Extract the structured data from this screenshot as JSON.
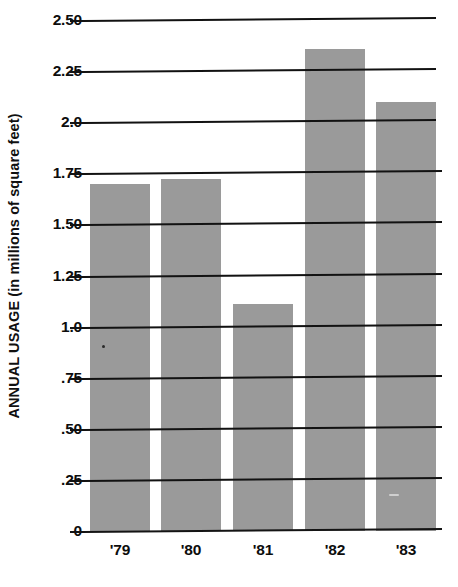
{
  "chart_data": {
    "type": "bar",
    "title": "",
    "subtitle": "",
    "xlabel": "",
    "ylabel": "ANNUAL USAGE (in millions of square feet)",
    "categories": [
      "'79",
      "'80",
      "'81",
      "'82",
      "'83"
    ],
    "values": [
      1.7,
      1.72,
      1.11,
      2.36,
      2.1
    ],
    "series": [
      {
        "name": "Annual usage",
        "values": [
          1.7,
          1.72,
          1.11,
          2.36,
          2.1
        ]
      }
    ],
    "ylim": [
      0,
      2.5
    ],
    "ytick_values": [
      0,
      0.25,
      0.5,
      0.75,
      1.0,
      1.25,
      1.5,
      1.75,
      2.0,
      2.25,
      2.5
    ],
    "ytick_labels": [
      "0",
      ".25",
      ".50",
      ".75",
      "1.0",
      "1.25",
      "1.50",
      "1.75",
      "2.0",
      "2.25",
      "2.50"
    ],
    "grid": true,
    "grid_axis": "y",
    "legend": false,
    "legend_position": "none",
    "bar_color": "#9a9a9a",
    "grid_color": "#121212",
    "axis_color": "#141414",
    "text_color": "#0d0d0d",
    "background_color": "#ffffff",
    "annotations": []
  },
  "axes": {
    "y_title": "ANNUAL USAGE (in millions of square feet)",
    "y_ticks": [
      {
        "label": "2.50",
        "value": 2.5
      },
      {
        "label": "2.25",
        "value": 2.25
      },
      {
        "label": "2.0",
        "value": 2.0
      },
      {
        "label": "1.75",
        "value": 1.75
      },
      {
        "label": "1.50",
        "value": 1.5
      },
      {
        "label": "1.25",
        "value": 1.25
      },
      {
        "label": "1.0",
        "value": 1.0
      },
      {
        "label": ".75",
        "value": 0.75
      },
      {
        "label": ".50",
        "value": 0.5
      },
      {
        "label": ".25",
        "value": 0.25
      },
      {
        "label": "0",
        "value": 0
      }
    ],
    "x_ticks": [
      {
        "label": "'79",
        "value": 1979
      },
      {
        "label": "'80",
        "value": 1980
      },
      {
        "label": "'81",
        "value": 1981
      },
      {
        "label": "'82",
        "value": 1982
      },
      {
        "label": "'83",
        "value": 1983
      }
    ]
  },
  "bars": [
    {
      "category": "'79",
      "value": 1.7
    },
    {
      "category": "'80",
      "value": 1.72
    },
    {
      "category": "'81",
      "value": 1.11
    },
    {
      "category": "'82",
      "value": 2.36
    },
    {
      "category": "'83",
      "value": 2.1
    }
  ]
}
